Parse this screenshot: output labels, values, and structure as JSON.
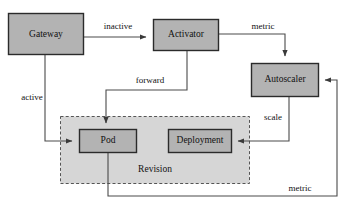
{
  "diagram": {
    "colors": {
      "node_fill": "#b3b3b3",
      "node_stroke": "#2b2b2b",
      "group_fill": "#d6d6d6",
      "group_stroke": "#555555",
      "edge_stroke": "#4a4a4a",
      "background": "#ffffff",
      "text": "#111111"
    },
    "nodes": [
      {
        "id": "gateway",
        "label": "Gateway"
      },
      {
        "id": "activator",
        "label": "Activator"
      },
      {
        "id": "autoscaler",
        "label": "Autoscaler"
      },
      {
        "id": "pod",
        "label": "Pod"
      },
      {
        "id": "deployment",
        "label": "Deployment"
      }
    ],
    "groups": [
      {
        "id": "revision",
        "label": "Revision",
        "contains": [
          "pod",
          "deployment"
        ]
      }
    ],
    "edges": [
      {
        "id": "gateway-to-activator",
        "from": "gateway",
        "to": "activator",
        "label": "inactive"
      },
      {
        "id": "activator-to-autoscaler",
        "from": "activator",
        "to": "autoscaler",
        "label": "metric"
      },
      {
        "id": "activator-to-pod",
        "from": "activator",
        "to": "pod",
        "label": "forward"
      },
      {
        "id": "gateway-to-pod",
        "from": "gateway",
        "to": "pod",
        "label": "active"
      },
      {
        "id": "autoscaler-to-deployment",
        "from": "autoscaler",
        "to": "deployment",
        "label": "scale"
      },
      {
        "id": "pod-to-autoscaler",
        "from": "pod",
        "to": "autoscaler",
        "label": "metric"
      }
    ]
  }
}
